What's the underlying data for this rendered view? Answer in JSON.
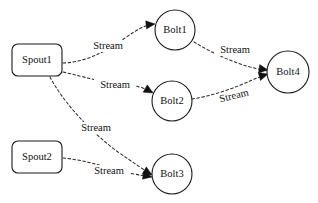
{
  "diagram": {
    "type": "directed-graph",
    "background_color": "#ffffff",
    "stroke_color": "#1a1a1a",
    "nodes": [
      {
        "id": "spout1",
        "label": "Spout1",
        "shape": "rounded-rect",
        "x": 12,
        "y": 44,
        "width": 50,
        "height": 32,
        "rx": 6,
        "cx": 37,
        "cy": 60
      },
      {
        "id": "spout2",
        "label": "Spout2",
        "shape": "rounded-rect",
        "x": 12,
        "y": 141,
        "width": 50,
        "height": 32,
        "rx": 6,
        "cx": 37,
        "cy": 157
      },
      {
        "id": "bolt1",
        "label": "Bolt1",
        "shape": "circle",
        "cx": 175,
        "cy": 30,
        "r": 20
      },
      {
        "id": "bolt2",
        "label": "Bolt2",
        "shape": "circle",
        "cx": 172,
        "cy": 101,
        "r": 20
      },
      {
        "id": "bolt3",
        "label": "Bolt3",
        "shape": "circle",
        "cx": 172,
        "cy": 174,
        "r": 20
      },
      {
        "id": "bolt4",
        "label": "Bolt4",
        "shape": "circle",
        "cx": 288,
        "cy": 72,
        "r": 21
      }
    ],
    "edges": [
      {
        "id": "e1",
        "from": "spout1",
        "to": "bolt1",
        "label": "Stream",
        "path": "M 63 63 C 90 62 110 48 125 38 C 138 29 145 25 154 24",
        "label_x": 108,
        "label_y": 46,
        "arrow_x": 155,
        "arrow_y": 24,
        "arrow_angle": -6
      },
      {
        "id": "e2",
        "from": "spout1",
        "to": "bolt2",
        "label": "Stream",
        "path": "M 63 72 C 85 77 100 82 120 84 C 135 85 145 88 152 92",
        "label_x": 115,
        "label_y": 85,
        "arrow_x": 153,
        "arrow_y": 93,
        "arrow_angle": 30
      },
      {
        "id": "e3",
        "from": "spout1",
        "to": "bolt3",
        "label": "Stream",
        "path": "M 50 77 C 62 100 88 130 118 152 C 134 163 144 170 151 174",
        "label_x": 96,
        "label_y": 128,
        "arrow_x": 152,
        "arrow_y": 175,
        "arrow_angle": 30
      },
      {
        "id": "e4",
        "from": "spout2",
        "to": "bolt3",
        "label": "Stream",
        "path": "M 63 158 C 85 160 105 167 125 172 C 138 175 146 176 151 177",
        "label_x": 109,
        "label_y": 171,
        "arrow_x": 152,
        "arrow_y": 177,
        "arrow_angle": 12
      },
      {
        "id": "e5",
        "from": "bolt1",
        "to": "bolt4",
        "label": "Stream",
        "path": "M 194 42 C 212 53 232 62 250 67 C 258 69 263 70 267 70",
        "label_x": 235,
        "label_y": 50,
        "arrow_x": 268,
        "arrow_y": 70,
        "arrow_angle": 8
      },
      {
        "id": "e6",
        "from": "bolt2",
        "to": "bolt4",
        "label": "Stream",
        "path": "M 192 99 C 212 96 235 88 252 80 C 260 77 264 75 267 74",
        "label_x": 234,
        "label_y": 96,
        "label_rotate": -14,
        "arrow_x": 268,
        "arrow_y": 74,
        "arrow_angle": -16
      }
    ]
  }
}
